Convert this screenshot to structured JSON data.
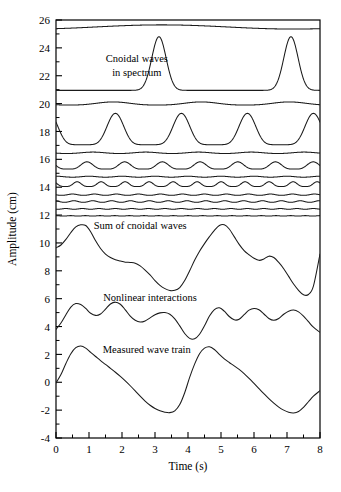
{
  "figure": {
    "name": "cnoidal-wave-decomposition",
    "background": "#ffffff",
    "line_color": "#1a1a1a",
    "axis_color": "#000000"
  },
  "chart_data": {
    "type": "line",
    "title": "",
    "xlabel": "Time (s)",
    "ylabel": "Amplitude  (cm)",
    "xlim": [
      0,
      8
    ],
    "ylim": [
      -4,
      26
    ],
    "xticks": [
      0,
      1,
      2,
      3,
      4,
      5,
      6,
      7,
      8
    ],
    "xticklabels": [
      "0",
      "1",
      "2",
      "3",
      "4",
      "5",
      "6",
      "7",
      "8"
    ],
    "yticks": [
      -4,
      -2,
      0,
      2,
      4,
      6,
      8,
      10,
      12,
      14,
      16,
      18,
      20,
      22,
      24,
      26
    ],
    "yticklabels": [
      "-4",
      "-2",
      "0",
      "2",
      "4",
      "6",
      "8",
      "10",
      "12",
      "14",
      "16",
      "18",
      "20",
      "22",
      "24",
      "26"
    ],
    "minor_yticks": [
      -3,
      -1,
      1,
      3,
      5,
      7,
      9,
      11,
      13,
      15,
      17,
      19,
      21,
      23,
      25
    ],
    "minor_xticks": [
      0.5,
      1.5,
      2.5,
      3.5,
      4.5,
      5.5,
      6.5,
      7.5
    ],
    "grid": false,
    "legend": "none",
    "frame": true,
    "annotations": [
      {
        "name": "cnoidal-waves-label",
        "text": "Cnoidal waves",
        "x": 2.45,
        "y": 23.0
      },
      {
        "name": "in-spectrum-label",
        "text": "in spectrum",
        "x": 2.45,
        "y": 22.0
      },
      {
        "name": "sum-of-cnoidal-waves-label",
        "text": "Sum of cnoidal waves",
        "x": 2.55,
        "y": 11.0
      },
      {
        "name": "nonlinear-interactions-label",
        "text": "Nonlinear interactions",
        "x": 2.85,
        "y": 5.8
      },
      {
        "name": "measured-wave-train-label",
        "text": "Measured wave train",
        "x": 2.75,
        "y": 2.1
      }
    ],
    "series": [
      {
        "name": "component-01-lowest-mode",
        "baseline": 25.35,
        "amplitude": 0.3,
        "cycles": 1,
        "shape": "cnoidal",
        "sharpness": 0.0,
        "phase": 0.6
      },
      {
        "name": "component-02-two-peaks",
        "baseline": 20.95,
        "amplitude": 3.85,
        "cycles": 2,
        "shape": "cnoidal",
        "sharpness": 0.86,
        "phase": 0.22
      },
      {
        "name": "component-03-broad",
        "baseline": 19.9,
        "amplitude": 0.22,
        "cycles": 3,
        "shape": "cnoidal",
        "sharpness": 0.15,
        "phase": 0.35
      },
      {
        "name": "component-04-four-peaks",
        "baseline": 17.05,
        "amplitude": 2.25,
        "cycles": 4,
        "shape": "cnoidal",
        "sharpness": 0.32,
        "phase": 0.1
      },
      {
        "name": "component-05-flatish",
        "baseline": 16.42,
        "amplitude": 0.1,
        "cycles": 5,
        "shape": "cnoidal",
        "sharpness": 0.1,
        "phase": 0.3
      },
      {
        "name": "component-06-ripple-a",
        "baseline": 15.3,
        "amplitude": 0.52,
        "cycles": 7,
        "shape": "cnoidal",
        "sharpness": 0.22,
        "phase": 0.18
      },
      {
        "name": "component-07-flat-a",
        "baseline": 14.72,
        "amplitude": 0.07,
        "cycles": 8,
        "shape": "cnoidal",
        "sharpness": 0.1,
        "phase": 0.0
      },
      {
        "name": "component-08-ripple-b",
        "baseline": 14.05,
        "amplitude": 0.34,
        "cycles": 11,
        "shape": "cnoidal",
        "sharpness": 0.2,
        "phase": 0.12
      },
      {
        "name": "component-09-ripple-c",
        "baseline": 13.42,
        "amplitude": 0.09,
        "cycles": 12,
        "shape": "cnoidal",
        "sharpness": 0.12,
        "phase": 0.25
      },
      {
        "name": "component-10-ripple-d",
        "baseline": 12.92,
        "amplitude": 0.11,
        "cycles": 14,
        "shape": "cnoidal",
        "sharpness": 0.12,
        "phase": 0.05
      },
      {
        "name": "component-11-flat-b",
        "baseline": 12.42,
        "amplitude": 0.05,
        "cycles": 16,
        "shape": "cnoidal",
        "sharpness": 0.1,
        "phase": 0.4
      },
      {
        "name": "component-12-flat-c",
        "baseline": 11.93,
        "amplitude": 0.03,
        "cycles": 18,
        "shape": "cnoidal",
        "sharpness": 0.1,
        "phase": 0.0
      },
      {
        "name": "sum-of-cnoidal-waves",
        "type": "composite",
        "x": [
          0.0,
          0.15,
          0.3,
          0.45,
          0.6,
          0.75,
          0.9,
          1.05,
          1.2,
          1.35,
          1.5,
          1.65,
          1.8,
          1.95,
          2.1,
          2.25,
          2.4,
          2.55,
          2.7,
          2.85,
          3.0,
          3.15,
          3.3,
          3.45,
          3.6,
          3.75,
          3.9,
          4.05,
          4.2,
          4.35,
          4.5,
          4.65,
          4.8,
          4.95,
          5.1,
          5.25,
          5.4,
          5.55,
          5.7,
          5.85,
          6.0,
          6.15,
          6.3,
          6.45,
          6.6,
          6.75,
          6.9,
          7.05,
          7.2,
          7.35,
          7.5,
          7.65,
          7.8,
          8.0
        ],
        "y": [
          9.65,
          9.85,
          10.25,
          10.75,
          11.15,
          11.3,
          11.25,
          10.8,
          10.15,
          9.6,
          9.2,
          8.95,
          8.8,
          8.7,
          8.62,
          8.6,
          8.55,
          8.35,
          8.05,
          7.7,
          7.3,
          6.95,
          6.72,
          6.58,
          6.6,
          6.8,
          7.3,
          8.0,
          8.75,
          9.4,
          9.95,
          10.45,
          10.9,
          11.25,
          11.3,
          11.0,
          10.45,
          9.9,
          9.45,
          9.15,
          8.9,
          8.75,
          8.85,
          9.05,
          8.95,
          8.6,
          8.15,
          7.6,
          7.05,
          6.6,
          6.28,
          6.3,
          6.9,
          9.2
        ]
      },
      {
        "name": "nonlinear-interactions",
        "type": "composite",
        "x": [
          0.0,
          0.15,
          0.3,
          0.45,
          0.6,
          0.75,
          0.9,
          1.05,
          1.2,
          1.35,
          1.5,
          1.65,
          1.8,
          1.95,
          2.1,
          2.25,
          2.4,
          2.55,
          2.7,
          2.85,
          3.0,
          3.15,
          3.3,
          3.45,
          3.6,
          3.75,
          3.9,
          4.05,
          4.2,
          4.35,
          4.5,
          4.65,
          4.8,
          4.95,
          5.1,
          5.25,
          5.4,
          5.55,
          5.7,
          5.85,
          6.0,
          6.15,
          6.3,
          6.45,
          6.6,
          6.75,
          6.9,
          7.05,
          7.2,
          7.35,
          7.5,
          7.65,
          7.8,
          8.0
        ],
        "y": [
          3.8,
          4.25,
          4.85,
          5.4,
          5.65,
          5.58,
          5.3,
          4.95,
          4.8,
          4.9,
          5.25,
          5.62,
          5.75,
          5.6,
          5.2,
          4.75,
          4.45,
          4.32,
          4.4,
          4.62,
          4.85,
          4.98,
          5.0,
          4.88,
          4.55,
          4.05,
          3.5,
          3.15,
          3.12,
          3.45,
          4.05,
          4.75,
          5.22,
          5.35,
          5.1,
          4.72,
          4.48,
          4.52,
          4.85,
          5.18,
          5.3,
          5.2,
          4.9,
          4.58,
          4.45,
          4.58,
          4.88,
          5.1,
          5.18,
          5.05,
          4.75,
          4.35,
          3.95,
          3.58
        ]
      },
      {
        "name": "measured-wave-train",
        "type": "composite",
        "x": [
          0.0,
          0.15,
          0.3,
          0.45,
          0.6,
          0.75,
          0.9,
          1.05,
          1.2,
          1.35,
          1.5,
          1.65,
          1.8,
          1.95,
          2.1,
          2.25,
          2.4,
          2.55,
          2.7,
          2.85,
          3.0,
          3.15,
          3.3,
          3.45,
          3.6,
          3.75,
          3.9,
          4.05,
          4.2,
          4.35,
          4.5,
          4.65,
          4.8,
          4.95,
          5.1,
          5.25,
          5.4,
          5.55,
          5.7,
          5.85,
          6.0,
          6.15,
          6.3,
          6.45,
          6.6,
          6.75,
          6.9,
          7.05,
          7.2,
          7.35,
          7.5,
          7.65,
          7.8,
          8.0
        ],
        "y": [
          -0.05,
          0.55,
          1.35,
          2.05,
          2.48,
          2.6,
          2.45,
          2.15,
          1.85,
          1.55,
          1.28,
          1.0,
          0.72,
          0.42,
          0.1,
          -0.25,
          -0.62,
          -1.0,
          -1.35,
          -1.65,
          -1.88,
          -2.05,
          -2.15,
          -2.18,
          -2.05,
          -1.6,
          -0.75,
          0.35,
          1.3,
          2.05,
          2.45,
          2.55,
          2.35,
          2.0,
          1.68,
          1.42,
          1.18,
          0.92,
          0.62,
          0.28,
          -0.08,
          -0.45,
          -0.82,
          -1.18,
          -1.5,
          -1.78,
          -2.0,
          -2.15,
          -2.2,
          -2.1,
          -1.8,
          -1.4,
          -1.0,
          -0.6
        ]
      }
    ]
  }
}
